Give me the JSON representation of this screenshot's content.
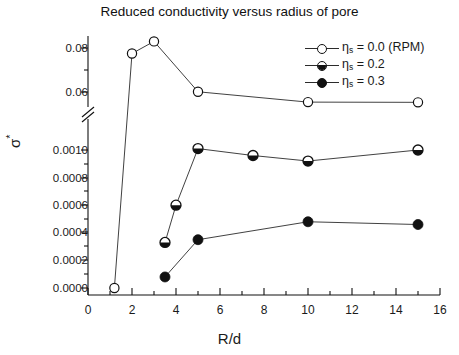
{
  "chart_data": {
    "type": "line",
    "title": "Reduced conductivity versus radius of pore",
    "xlabel": "R/d",
    "ylabel": "σ*",
    "xlim": [
      0,
      16
    ],
    "xticks": [
      0,
      2,
      4,
      6,
      8,
      10,
      12,
      14,
      16
    ],
    "broken_axis": true,
    "y_upper": {
      "lim": [
        0.055,
        0.085
      ],
      "ticks": [
        0.06,
        0.08
      ],
      "ticklabels": [
        "0.06",
        "0.08"
      ],
      "minor_ticks": [
        0.07
      ]
    },
    "y_lower": {
      "lim": [
        0.0,
        0.00108
      ],
      "ticks": [
        0.0,
        0.0002,
        0.0004,
        0.0006,
        0.0008,
        0.001
      ],
      "ticklabels": [
        "0.0000",
        "0.0002",
        "0.0004",
        "0.0006",
        "0.0008",
        "0.0010"
      ],
      "minor_ticks": [
        0.0001,
        0.0003,
        0.0005,
        0.0007,
        0.0009
      ]
    },
    "grid": false,
    "legend_position": "upper right",
    "series": [
      {
        "name": "ηs = 0.0 (RPM)",
        "legend_label": "η",
        "legend_sub": "s",
        "legend_rest": " = 0.0 (RPM)",
        "marker": "open-circle",
        "panel": "mixed",
        "x": [
          1.2,
          2.0,
          3.0,
          5.0,
          10.0,
          15.0
        ],
        "y": [
          0.0,
          0.0775,
          0.083,
          0.0601,
          0.0554,
          0.0553
        ]
      },
      {
        "name": "ηs = 0.2",
        "legend_label": "η",
        "legend_sub": "s",
        "legend_rest": " = 0.2",
        "marker": "half-filled-circle",
        "panel": "lower",
        "x": [
          3.5,
          4.0,
          5.0,
          7.5,
          10.0,
          15.0
        ],
        "y": [
          0.00033,
          0.0006,
          0.00101,
          0.00096,
          0.00092,
          0.001
        ]
      },
      {
        "name": "ηs = 0.3",
        "legend_label": "η",
        "legend_sub": "s",
        "legend_rest": " = 0.3",
        "marker": "filled-circle",
        "panel": "lower",
        "x": [
          3.5,
          5.0,
          10.0,
          15.0
        ],
        "y": [
          8e-05,
          0.00035,
          0.00048,
          0.00046
        ]
      }
    ]
  },
  "axes": {
    "xtick_labels": [
      "0",
      "2",
      "4",
      "6",
      "8",
      "10",
      "12",
      "14",
      "16"
    ],
    "ytick_labels_upper": [
      "0.08",
      "0.06"
    ],
    "ytick_labels_lower": [
      "0.0010",
      "0.0008",
      "0.0006",
      "0.0004",
      "0.0002",
      "0.0000"
    ]
  },
  "colors": {
    "line": "#2b2b2b",
    "marker_fill": "#111111",
    "marker_open": "#ffffff",
    "axis": "#111111",
    "background": "#ffffff"
  }
}
